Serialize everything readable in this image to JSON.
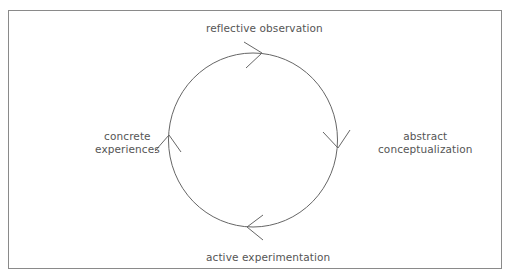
{
  "diagram": {
    "type": "cycle",
    "direction": "clockwise",
    "stages": [
      {
        "position": "top",
        "label": "reflective observation"
      },
      {
        "position": "right",
        "line1": "abstract",
        "line2": "conceptualization"
      },
      {
        "position": "bottom",
        "label": "active experimentation"
      },
      {
        "position": "left",
        "line1": "concrete",
        "line2": "experiences"
      }
    ],
    "colors": {
      "line": "#666666",
      "frame": "#8a8a8a",
      "text": "#555555"
    }
  }
}
